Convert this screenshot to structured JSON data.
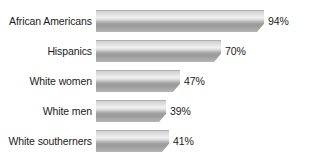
{
  "chart_data": {
    "type": "bar",
    "orientation": "horizontal",
    "title": "",
    "xlabel": "",
    "ylabel": "",
    "xlim": [
      0,
      100
    ],
    "grid": false,
    "legend": false,
    "value_suffix": "%",
    "categories": [
      "African Americans",
      "Hispanics",
      "White women",
      "White men",
      "White southerners"
    ],
    "values": [
      94,
      70,
      47,
      39,
      41
    ],
    "value_labels": [
      "94%",
      "70%",
      "47%",
      "39%",
      "41%"
    ],
    "bars": [
      {
        "label": "African Americans",
        "value": 94,
        "value_label": "94%"
      },
      {
        "label": "Hispanics",
        "value": 70,
        "value_label": "70%"
      },
      {
        "label": "White women",
        "value": 47,
        "value_label": "47%"
      },
      {
        "label": "White men",
        "value": 39,
        "value_label": "39%"
      },
      {
        "label": "White southerners",
        "value": 41,
        "value_label": "41%"
      }
    ]
  },
  "title_remnant": "",
  "colors": {
    "background": "#ffffff",
    "text": "#1b1b1b",
    "bar_light": "#f0f0f0",
    "bar_mid": "#c9c9c9",
    "bar_dark": "#9a9a9a"
  }
}
